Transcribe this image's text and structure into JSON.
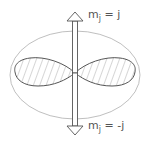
{
  "diagram": {
    "top_label": {
      "main": "m",
      "sub": "j",
      "rest": " = j"
    },
    "bottom_label": {
      "main": "m",
      "sub": "j",
      "rest": " = -j"
    },
    "colors": {
      "ellipse": "#b8b8b8",
      "lobe": "#555555",
      "hatch": "#888888",
      "arrow": "#555555"
    }
  }
}
